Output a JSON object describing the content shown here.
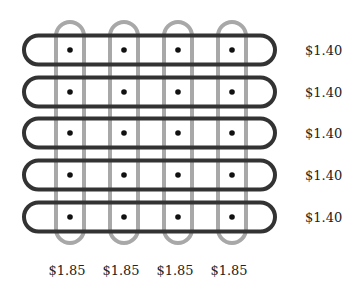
{
  "diagram": {
    "type": "grid-of-loops",
    "colors": {
      "horizontal_loop": "#333333",
      "vertical_loop": "#a8a8a8",
      "dot": "#111111",
      "text": "#222222",
      "background": "#ffffff"
    },
    "rows": [
      {
        "label": "$1.40",
        "y": 50
      },
      {
        "label": "$1.40",
        "y": 92
      },
      {
        "label": "$1.40",
        "y": 133
      },
      {
        "label": "$1.40",
        "y": 175
      },
      {
        "label": "$1.40",
        "y": 217
      }
    ],
    "columns": [
      {
        "label": "$1.85",
        "x": 70
      },
      {
        "label": "$1.85",
        "x": 124
      },
      {
        "label": "$1.85",
        "x": 178
      },
      {
        "label": "$1.85",
        "x": 232
      }
    ]
  }
}
